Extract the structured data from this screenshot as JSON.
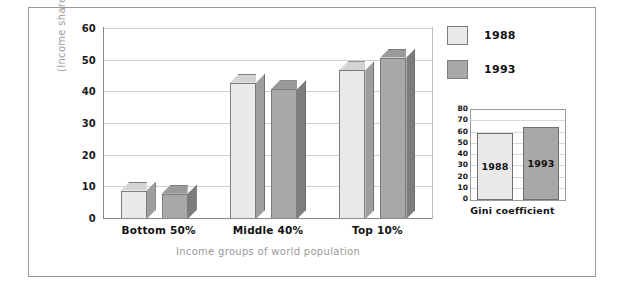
{
  "chart_data": {
    "type": "bar",
    "title": "",
    "xlabel": "Income groups of world population",
    "ylabel": "(Income share)",
    "categories": [
      "Bottom 50%",
      "Middle 40%",
      "Top 10%"
    ],
    "series": [
      {
        "name": "1988",
        "values": [
          9,
          43,
          47
        ],
        "color": "#e9e9e9"
      },
      {
        "name": "1993",
        "values": [
          8,
          41,
          51
        ],
        "color": "#a8a8a8"
      }
    ],
    "ylim": [
      0,
      60
    ],
    "yticks": [
      0,
      10,
      20,
      30,
      40,
      50,
      60
    ],
    "ytick_labels": [
      "0",
      "10",
      "20",
      "30",
      "40",
      "50",
      "60"
    ],
    "grid": true,
    "legend_position": "right",
    "style": "3d-bars"
  },
  "inset_chart": {
    "type": "bar",
    "title": "Gini coefficient",
    "categories": [
      "1988",
      "1993"
    ],
    "values": [
      60,
      65
    ],
    "bar_labels": [
      "1988",
      "1993"
    ],
    "ylim": [
      0,
      80
    ],
    "yticks": [
      0,
      10,
      20,
      30,
      40,
      50,
      60,
      70,
      80
    ],
    "ytick_labels": [
      "0",
      "10",
      "20",
      "30",
      "40",
      "50",
      "60",
      "70",
      "80"
    ],
    "colors": [
      "#e9e9e9",
      "#a8a8a8"
    ],
    "grid": true
  },
  "legend": {
    "items": [
      {
        "label": "1988",
        "color": "#e9e9e9"
      },
      {
        "label": "1993",
        "color": "#a8a8a8"
      }
    ]
  },
  "colors": {
    "series_1988_front": "#e9e9e9",
    "series_1988_top": "#d4d4d4",
    "series_1988_side": "#9e9e9e",
    "series_1993_front": "#a8a8a8",
    "series_1993_top": "#9a9a9a",
    "series_1993_side": "#7d7d7d",
    "gridline": "#cfcfcf",
    "axis": "#8a8a8a",
    "frame": "#9a9a9a",
    "axis_text": "#1a1a1a",
    "axis_title_text": "#9a9a9a"
  }
}
